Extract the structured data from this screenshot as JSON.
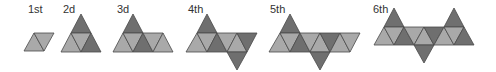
{
  "colors": {
    "light": "#a9a9a9",
    "dark": "#6f6f6f",
    "outline": "#4a4a4a",
    "text": "#333333"
  },
  "figures": [
    {
      "label": "1st",
      "label_x": 28,
      "label_y": 13,
      "triangles": [
        {
          "pts": "24,51 34,33 44,51",
          "tone": "light"
        },
        {
          "pts": "34,33 54,33 44,51",
          "tone": "light"
        }
      ]
    },
    {
      "label": "2d",
      "label_x": 63,
      "label_y": 13,
      "triangles": [
        {
          "pts": "81,14 71,33 91,33",
          "tone": "dark"
        },
        {
          "pts": "61,52 71,33 81,52",
          "tone": "light"
        },
        {
          "pts": "71,33 91,33 81,52",
          "tone": "light"
        },
        {
          "pts": "81,52 91,33 101,52",
          "tone": "dark"
        }
      ]
    },
    {
      "label": "3d",
      "label_x": 117,
      "label_y": 13,
      "triangles": [
        {
          "pts": "133,14 123,33 143,33",
          "tone": "dark"
        },
        {
          "pts": "113,52 123,33 133,52",
          "tone": "light"
        },
        {
          "pts": "123,33 143,33 133,52",
          "tone": "light"
        },
        {
          "pts": "133,52 143,33 153,52",
          "tone": "dark"
        },
        {
          "pts": "143,33 163,33 153,52",
          "tone": "light"
        },
        {
          "pts": "153,52 163,33 173,52",
          "tone": "light"
        }
      ]
    },
    {
      "label": "4th",
      "label_x": 188,
      "label_y": 13,
      "triangles": [
        {
          "pts": "207,14 197,33 217,33",
          "tone": "dark"
        },
        {
          "pts": "186,52 197,33 207,52",
          "tone": "light"
        },
        {
          "pts": "197,33 217,33 207,52",
          "tone": "light"
        },
        {
          "pts": "207,52 217,33 227,52",
          "tone": "dark"
        },
        {
          "pts": "217,33 237,33 227,52",
          "tone": "light"
        },
        {
          "pts": "227,52 237,33 247,52",
          "tone": "light"
        },
        {
          "pts": "237,33 257,33 247,52",
          "tone": "dark"
        },
        {
          "pts": "227,52 247,52 237,70",
          "tone": "dark"
        }
      ]
    },
    {
      "label": "5th",
      "label_x": 270,
      "label_y": 13,
      "triangles": [
        {
          "pts": "290,14 280,33 300,33",
          "tone": "dark"
        },
        {
          "pts": "269,52 280,33 290,52",
          "tone": "light"
        },
        {
          "pts": "280,33 300,33 290,52",
          "tone": "light"
        },
        {
          "pts": "290,52 300,33 310,52",
          "tone": "dark"
        },
        {
          "pts": "300,33 320,33 310,52",
          "tone": "light"
        },
        {
          "pts": "310,52 320,33 330,52",
          "tone": "light"
        },
        {
          "pts": "320,33 340,33 330,52",
          "tone": "dark"
        },
        {
          "pts": "330,52 340,33 350,52",
          "tone": "light"
        },
        {
          "pts": "340,33 360,33 350,52",
          "tone": "light"
        },
        {
          "pts": "310,52 330,52 320,70",
          "tone": "dark"
        }
      ]
    },
    {
      "label": "6th",
      "label_x": 373,
      "label_y": 13,
      "triangles": [
        {
          "pts": "394,8 384,27 404,27",
          "tone": "dark"
        },
        {
          "pts": "454,8 444,27 464,27",
          "tone": "dark"
        },
        {
          "pts": "374,45 384,27 394,45",
          "tone": "light"
        },
        {
          "pts": "384,27 404,27 394,45",
          "tone": "light"
        },
        {
          "pts": "394,45 404,27 414,45",
          "tone": "dark"
        },
        {
          "pts": "404,27 424,27 414,45",
          "tone": "light"
        },
        {
          "pts": "414,45 424,27 434,45",
          "tone": "light"
        },
        {
          "pts": "424,27 444,27 434,45",
          "tone": "dark"
        },
        {
          "pts": "434,45 444,27 454,45",
          "tone": "light"
        },
        {
          "pts": "444,27 464,27 454,45",
          "tone": "light"
        },
        {
          "pts": "454,45 464,27 474,45",
          "tone": "dark"
        },
        {
          "pts": "414,45 434,45 424,63",
          "tone": "dark"
        }
      ]
    }
  ]
}
